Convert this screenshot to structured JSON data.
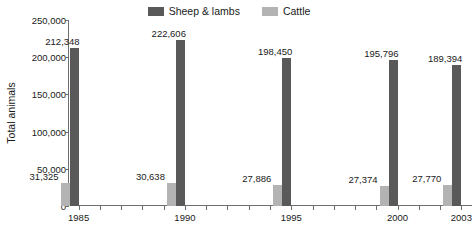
{
  "legend": {
    "entries": [
      {
        "label": "Sheep & lambs",
        "color": "#595959",
        "swatch_icon": "legend-swatch-icon"
      },
      {
        "label": "Cattle",
        "color": "#b3b3b3",
        "swatch_icon": "legend-swatch-icon"
      }
    ]
  },
  "chart_data": {
    "type": "bar",
    "title": "",
    "subtitle": "",
    "xlabel": "",
    "ylabel": "Total animals",
    "ylim": [
      0,
      250000
    ],
    "ytick_labels": [
      "250,000",
      "200,000",
      "150,000",
      "100,000",
      "50,000",
      "0"
    ],
    "ytick_values": [
      250000,
      200000,
      150000,
      100000,
      50000,
      0
    ],
    "grid": false,
    "legend_position": "top-center",
    "xlim": [
      1984.5,
      2003.5
    ],
    "xtick_years": [
      1985,
      1986,
      1987,
      1988,
      1989,
      1990,
      1991,
      1992,
      1993,
      1994,
      1995,
      1996,
      1997,
      1998,
      1999,
      2000,
      2001,
      2002,
      2003
    ],
    "categories": [
      "1985",
      "1990",
      "1995",
      "2000",
      "2003"
    ],
    "xtick_labels": [
      "1985",
      "1990",
      "1995",
      "2000",
      "2003"
    ],
    "series": [
      {
        "name": "Cattle",
        "color": "#b3b3b3",
        "values": [
          31325,
          30638,
          27886,
          27374,
          27770
        ],
        "data_labels": [
          "31,325",
          "30,638",
          "27,886",
          "27,374",
          "27,770"
        ]
      },
      {
        "name": "Sheep & lambs",
        "color": "#595959",
        "values": [
          212348,
          222606,
          198450,
          195796,
          189394
        ],
        "data_labels": [
          "212,348",
          "222,606",
          "198,450",
          "195,796",
          "189,394"
        ]
      }
    ]
  }
}
